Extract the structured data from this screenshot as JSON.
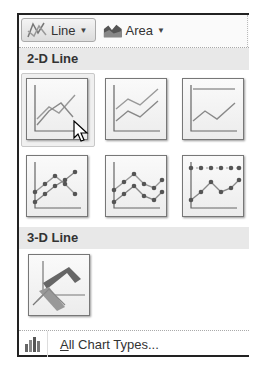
{
  "toolbar": {
    "buttons": [
      {
        "label": "Line",
        "icon": "line-chart-icon",
        "dropdown": true,
        "active": true
      },
      {
        "label": "Area",
        "icon": "area-chart-icon",
        "dropdown": true,
        "active": false
      }
    ]
  },
  "sections": [
    {
      "title": "2-D Line",
      "items": [
        {
          "name": "Line",
          "icon": "line-icon",
          "hovered": true
        },
        {
          "name": "Stacked Line",
          "icon": "stacked-line-icon"
        },
        {
          "name": "100% Stacked Line",
          "icon": "100-stacked-line-icon"
        },
        {
          "name": "Line with Markers",
          "icon": "line-markers-icon"
        },
        {
          "name": "Stacked Line with Markers",
          "icon": "stacked-line-markers-icon"
        },
        {
          "name": "100% Stacked Line with Markers",
          "icon": "100-stacked-line-markers-icon"
        }
      ]
    },
    {
      "title": "3-D Line",
      "items": [
        {
          "name": "3-D Line",
          "icon": "3d-line-icon"
        }
      ]
    }
  ],
  "footer": {
    "accel": "A",
    "label_rest": "ll Chart Types...",
    "icon": "chart-types-icon"
  },
  "colors": {
    "header_bg": "#e8e8e8",
    "line": "#8a8a8a",
    "marker": "#666666",
    "accent_3d": "#555555"
  }
}
